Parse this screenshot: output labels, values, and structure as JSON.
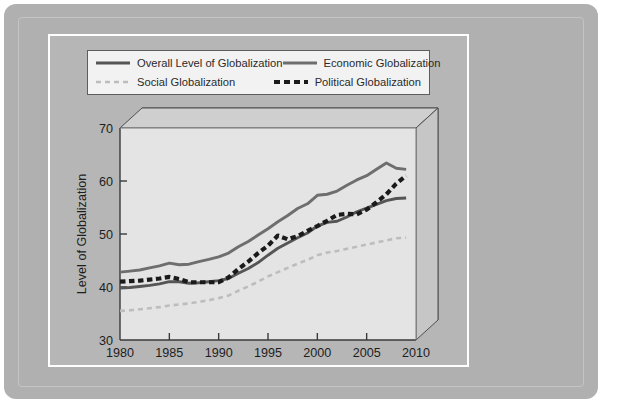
{
  "source_credit": "Source: Based on data from the 2012 KOF Index of Globalization.",
  "legend": {
    "items": [
      {
        "label": "Overall Level of Globalization",
        "style": "solid",
        "color": "#555555",
        "width": 3.0
      },
      {
        "label": "Economic Globalization",
        "style": "solid",
        "color": "#6e6e6e",
        "width": 3.0
      },
      {
        "label": "Social Globalization",
        "style": "dashed",
        "color": "#bdbdbd",
        "width": 2.4
      },
      {
        "label": "Political Globalization",
        "style": "dashed",
        "color": "#1a1a1a",
        "width": 3.4
      }
    ]
  },
  "axes": {
    "y_title": "Level of Globalization",
    "y_ticks": [
      "30",
      "40",
      "50",
      "60",
      "70"
    ],
    "x_ticks": [
      "1980",
      "1985",
      "1990",
      "1995",
      "2000",
      "2005",
      "2010"
    ]
  },
  "chart_data": {
    "type": "line",
    "title": "",
    "xlabel": "",
    "ylabel": "Level of Globalization",
    "xlim": [
      1980,
      2010
    ],
    "ylim": [
      30,
      70
    ],
    "grid": false,
    "legend_position": "top",
    "x": [
      1980,
      1981,
      1982,
      1983,
      1984,
      1985,
      1986,
      1987,
      1988,
      1989,
      1990,
      1991,
      1992,
      1993,
      1994,
      1995,
      1996,
      1997,
      1998,
      1999,
      2000,
      2001,
      2002,
      2003,
      2004,
      2005,
      2006,
      2007,
      2008,
      2009
    ],
    "series": [
      {
        "name": "Overall Level of Globalization",
        "color": "#555555",
        "style": "solid",
        "values": [
          39.8,
          39.9,
          40.1,
          40.3,
          40.6,
          41.0,
          41.0,
          40.7,
          40.8,
          41.0,
          41.2,
          41.6,
          42.6,
          43.5,
          44.6,
          46.0,
          47.3,
          48.3,
          49.3,
          50.2,
          51.5,
          52.2,
          52.4,
          53.2,
          54.2,
          54.9,
          55.6,
          56.3,
          56.7,
          56.8
        ]
      },
      {
        "name": "Economic Globalization",
        "color": "#6e6e6e",
        "style": "solid",
        "values": [
          42.8,
          43.0,
          43.2,
          43.6,
          44.0,
          44.5,
          44.2,
          44.3,
          44.8,
          45.2,
          45.7,
          46.4,
          47.6,
          48.6,
          49.8,
          51.0,
          52.3,
          53.5,
          54.8,
          55.7,
          57.3,
          57.5,
          58.1,
          59.2,
          60.2,
          61.0,
          62.2,
          63.4,
          62.4,
          62.2
        ]
      },
      {
        "name": "Social Globalization",
        "color": "#bdbdbd",
        "style": "dashed",
        "values": [
          35.5,
          35.6,
          35.8,
          36.0,
          36.2,
          36.5,
          36.7,
          36.9,
          37.2,
          37.5,
          37.9,
          38.4,
          39.3,
          40.1,
          41.0,
          42.0,
          42.8,
          43.6,
          44.4,
          45.1,
          46.0,
          46.5,
          46.8,
          47.2,
          47.6,
          48.0,
          48.4,
          48.8,
          49.2,
          49.3
        ]
      },
      {
        "name": "Political Globalization",
        "color": "#1a1a1a",
        "style": "dashed",
        "values": [
          41.0,
          41.1,
          41.2,
          41.4,
          41.6,
          41.9,
          41.5,
          40.9,
          40.9,
          40.9,
          40.9,
          41.8,
          43.4,
          44.8,
          46.4,
          47.8,
          49.7,
          49.0,
          49.6,
          50.6,
          51.5,
          52.5,
          53.6,
          53.8,
          53.7,
          54.6,
          56.0,
          57.5,
          59.5,
          61.0
        ]
      }
    ]
  }
}
